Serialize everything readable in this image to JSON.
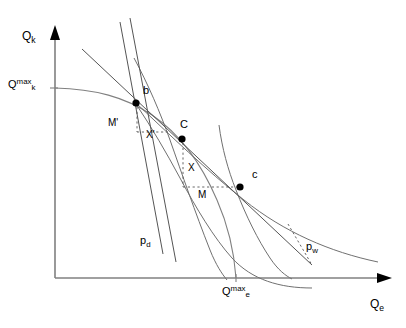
{
  "figure": {
    "type": "economics-diagram",
    "title": "",
    "background_color": "#ffffff",
    "width": 406,
    "height": 328
  },
  "axes": {
    "x_label": "Q",
    "x_label_sub": "e",
    "y_label": "Q",
    "y_label_sub": "k",
    "origin": {
      "x": 55,
      "y": 278
    },
    "x_axis_end": {
      "x": 392,
      "y": 278
    },
    "y_axis_top": {
      "x": 55,
      "y": 28
    }
  },
  "tick_labels": [
    {
      "name": "qk-max",
      "base": "Q",
      "sub": "k",
      "sup": "max",
      "x": 8,
      "y": 78
    },
    {
      "name": "qe-max",
      "base": "Q",
      "sub": "e",
      "sup": "max",
      "x": 222,
      "y": 285
    }
  ],
  "points": [
    {
      "name": "point-b",
      "label": "b",
      "x": 136,
      "y": 103,
      "label_x": 143,
      "label_y": 87
    },
    {
      "name": "point-C",
      "label": "C",
      "x": 182,
      "y": 138,
      "label_x": 182,
      "label_y": 120
    },
    {
      "name": "point-c",
      "label": "c",
      "x": 240,
      "y": 187,
      "label_x": 254,
      "label_y": 170
    }
  ],
  "annotations": [
    {
      "name": "label-M-prime",
      "text": "M'",
      "x": 110,
      "y": 118
    },
    {
      "name": "label-X-prime",
      "text": "X'",
      "x": 148,
      "y": 130
    },
    {
      "name": "label-X",
      "text": "X",
      "x": 188,
      "y": 164
    },
    {
      "name": "label-M",
      "text": "M",
      "x": 200,
      "y": 191
    },
    {
      "name": "label-pd",
      "base": "p",
      "sub": "d",
      "x": 140,
      "y": 237
    },
    {
      "name": "label-pw",
      "base": "p",
      "sub": "w",
      "x": 308,
      "y": 243
    }
  ],
  "curves": {
    "ppf": {
      "name": "production-possibility-frontier",
      "description": "concave transformation curve from Qk max through b to Qe max"
    },
    "indifference_high": {
      "name": "indifference-curve-C",
      "description": "convex indifference curve tangent at C"
    },
    "indifference_low": {
      "name": "indifference-curve-c",
      "description": "lower convex indifference curve through c"
    },
    "price_line_world": {
      "name": "world-price-line-pw",
      "description": "straight budget line with world price slope through b, C and c"
    },
    "price_line_domestic": {
      "name": "domestic-price-line-pd",
      "description": "steep straight line with domestic price slope through b"
    }
  },
  "colors": {
    "axis": "#808080",
    "curve": "#707070",
    "line": "#555555",
    "point": "#000000",
    "text": "#000000"
  }
}
